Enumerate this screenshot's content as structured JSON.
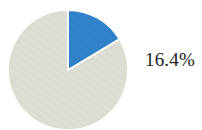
{
  "chart_data": {
    "type": "pie",
    "title": "",
    "subtitle": "",
    "xlabel": "",
    "ylabel": "",
    "legend": "none",
    "grid": false,
    "start_angle_deg": 90,
    "direction": "clockwise",
    "categories": [
      "Highlighted share",
      "Remainder"
    ],
    "values": [
      16.4,
      83.6
    ],
    "value_unit": "%",
    "slices": [
      {
        "label": "16.4%",
        "value": 16.4,
        "angle_deg": 59.04,
        "color": "#2f82c8",
        "label_shown": true
      },
      {
        "label": "83.6%",
        "value": 83.6,
        "angle_deg": 300.96,
        "color": "#dcdcd2",
        "label_shown": false
      }
    ],
    "annotations": [
      {
        "text": "16.4%",
        "position": "right-of-pie"
      }
    ]
  },
  "figure": {
    "background_color": "#ffffff",
    "label_color": "#231f20",
    "slice_separator_color": "#ffffff",
    "accent_color": "#2f82c8",
    "muted_color": "#dcdcd2",
    "value_label": "16.4%"
  }
}
